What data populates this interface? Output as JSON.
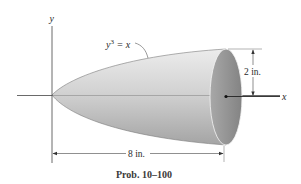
{
  "figure": {
    "caption": "Prob. 10–100",
    "axes": {
      "x_label": "x",
      "y_label": "y"
    },
    "curve_label": {
      "base": "y",
      "exponent": "3",
      "rest": " = x"
    },
    "dimensions": {
      "radius": "2 in.",
      "length": "8 in."
    },
    "colors": {
      "solid_light": "#e6e6e6",
      "solid_mid": "#bdbdbd",
      "solid_dark": "#9a9a9a",
      "end_face": "#8c8c8c",
      "line": "#333333"
    }
  }
}
